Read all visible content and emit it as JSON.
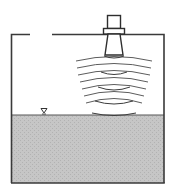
{
  "diagram": {
    "type": "ultrasonic-radar-level-measurement",
    "colors": {
      "line": "#3a3a3a",
      "liquid": "#c4c4c4",
      "liquid_texture": "#b4b4b4",
      "background": "#ffffff",
      "wave": "#4a4a4a"
    },
    "components": {
      "tank": "open-top tank with vent gap",
      "sensor": "non-contact level transmitter (horn/cone antenna)",
      "waves": "emitted signal wavefronts",
      "echo": "reflected signal wavefronts",
      "liquid": "process liquid",
      "level_marker": "liquid level symbol (inverted triangle)"
    },
    "labels": []
  }
}
